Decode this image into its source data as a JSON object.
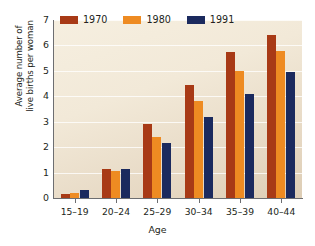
{
  "chart_data": {
    "type": "bar",
    "title": "",
    "xlabel": "Age",
    "ylabel": "Average number of\nlive births per woman",
    "categories": [
      "15–19",
      "20–24",
      "25–29",
      "30–34",
      "35–39",
      "40–44"
    ],
    "series": [
      {
        "name": "1970",
        "color": "#a83a16",
        "values": [
          0.15,
          1.15,
          2.9,
          4.45,
          5.75,
          6.4
        ]
      },
      {
        "name": "1980",
        "color": "#ee8b22",
        "values": [
          0.2,
          1.05,
          2.4,
          3.8,
          5.0,
          5.8
        ]
      },
      {
        "name": "1991",
        "color": "#1b2a5e",
        "values": [
          0.3,
          1.15,
          2.15,
          3.2,
          4.1,
          4.95
        ]
      }
    ],
    "ylim": [
      0,
      7
    ],
    "yticks": [
      0,
      1,
      2,
      3,
      4,
      5,
      6,
      7
    ],
    "ytick_labels": [
      "0",
      "1",
      "2",
      "3",
      "4",
      "5",
      "6",
      "7"
    ],
    "grid": "horizontal",
    "legend_position": "top-left",
    "plot_background": "#f2e9d8",
    "gridline_color": "#ffffff",
    "axis_color": "#6d6e71"
  }
}
